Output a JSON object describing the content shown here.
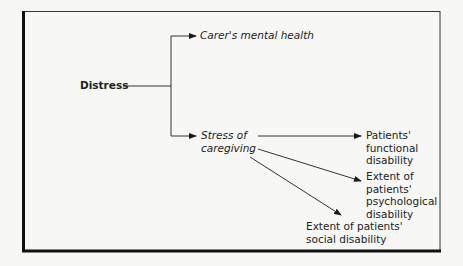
{
  "diagram": {
    "type": "flow-tree",
    "nodes": {
      "root": {
        "label": "Distress",
        "style": "bold"
      },
      "carer": {
        "label": "Carer's mental health",
        "style": "italic"
      },
      "stress": {
        "line1": "Stress of",
        "line2": "caregiving",
        "style": "italic"
      },
      "functional": {
        "line1": "Patients'",
        "line2": "functional",
        "line3": "disability"
      },
      "psychological": {
        "line1": "Extent of",
        "line2": "patients'",
        "line3": "psychological",
        "line4": "disability"
      },
      "social": {
        "line1": "Extent of patients'",
        "line2": "social disability"
      }
    },
    "edges": [
      {
        "from": "root",
        "to": "carer"
      },
      {
        "from": "root",
        "to": "stress"
      },
      {
        "from": "stress",
        "to": "functional"
      },
      {
        "from": "stress",
        "to": "psychological"
      },
      {
        "from": "stress",
        "to": "social"
      }
    ]
  }
}
